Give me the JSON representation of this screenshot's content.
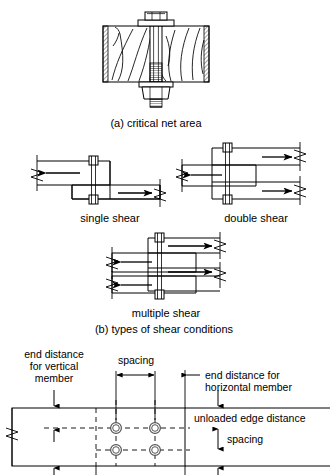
{
  "figure": {
    "title_a": "(a) critical net area",
    "title_b": "(b) types of shear conditions",
    "shear_labels": {
      "single": "single shear",
      "double": "double shear",
      "multiple": "multiple shear"
    },
    "dimension_labels": {
      "end_distance_vertical_line1": "end distance",
      "end_distance_vertical_line2": "for vertical",
      "end_distance_vertical_line3": "member",
      "spacing_top": "spacing",
      "end_distance_horizontal_line1": "end distance for",
      "end_distance_horizontal_line2": "horizontal member",
      "unloaded_edge_distance": "unloaded edge distance",
      "spacing_right": "spacing"
    },
    "colors": {
      "line": "#000000",
      "hatch": "#000000",
      "background": "#ffffff",
      "hole_ring": "#555555"
    }
  }
}
